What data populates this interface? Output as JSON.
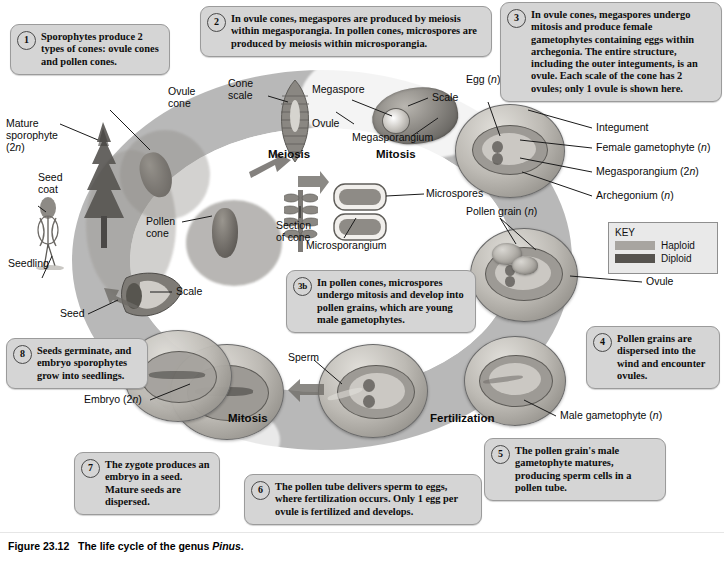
{
  "figure": {
    "number": "Figure 23.12",
    "caption": "The life cycle of the genus ",
    "caption_italic": "Pinus",
    "caption_end": "."
  },
  "key": {
    "title": "KEY",
    "items": [
      {
        "label": "Haploid",
        "color": "#a8a5a0"
      },
      {
        "label": "Diploid",
        "color": "#56534f"
      }
    ]
  },
  "callouts": [
    {
      "num": "1",
      "text": "Sporophytes produce 2 types of cones: ovule cones and pollen cones."
    },
    {
      "num": "2",
      "text": "In ovule cones, megaspores are produced by meiosis within megasporangia. In pollen cones, microspores are produced by meiosis within microsporangia."
    },
    {
      "num": "3",
      "text": "In ovule cones, megaspores undergo mitosis and produce female gametophytes containing eggs within archegonia. The entire structure, including the outer integuments, is an ovule. Each scale of the cone has 2 ovules; only 1 ovule is shown here."
    },
    {
      "num": "3b",
      "text": "In pollen cones, microspores undergo mitosis and develop into pollen grains, which are young male gametophytes."
    },
    {
      "num": "4",
      "text": "Pollen grains are dispersed into the wind and encounter ovules."
    },
    {
      "num": "5",
      "text": "The pollen grain's male gametophyte matures, producing sperm cells in a pollen tube."
    },
    {
      "num": "6",
      "text": "The pollen tube delivers sperm to eggs, where fertilization occurs. Only 1 egg per ovule is fertilized and develops."
    },
    {
      "num": "7",
      "text": "The zygote produces an embryo in a seed. Mature seeds are dispersed."
    },
    {
      "num": "8",
      "text": "Seeds germinate, and embryo sporophytes grow into seedlings."
    }
  ],
  "stages": [
    {
      "label": "Meiosis"
    },
    {
      "label": "Mitosis"
    },
    {
      "label": "Mitosis"
    },
    {
      "label": "Fertilization"
    }
  ],
  "labels": [
    {
      "name": "mature-sporophyte",
      "line1": "Mature",
      "line2": "sporophyte",
      "line3": "(2n)"
    },
    {
      "name": "seed-coat",
      "line1": "Seed",
      "line2": "coat"
    },
    {
      "name": "seedling",
      "line1": "Seedling"
    },
    {
      "name": "ovule-cone",
      "line1": "Ovule",
      "line2": "cone"
    },
    {
      "name": "cone-scale",
      "line1": "Cone",
      "line2": "scale"
    },
    {
      "name": "megaspore",
      "line1": "Megaspore"
    },
    {
      "name": "ovule-upper",
      "line1": "Ovule"
    },
    {
      "name": "scale-upper",
      "line1": "Scale"
    },
    {
      "name": "megasporangium-upper",
      "line1": "Megasporangium"
    },
    {
      "name": "egg",
      "line1": "Egg (n)"
    },
    {
      "name": "integument",
      "line1": "Integument"
    },
    {
      "name": "female-gametophyte",
      "line1": "Female gametophyte (n)"
    },
    {
      "name": "megasporangium-right",
      "line1": "Megasporangium (2n)"
    },
    {
      "name": "archegonium",
      "line1": "Archegonium (n)"
    },
    {
      "name": "pollen-cone",
      "line1": "Pollen",
      "line2": "cone"
    },
    {
      "name": "section-of-cone",
      "line1": "Section",
      "line2": "of cone"
    },
    {
      "name": "microsporangium",
      "line1": "Microsporangium"
    },
    {
      "name": "microspores",
      "line1": "Microspores"
    },
    {
      "name": "pollen-grain",
      "line1": "Pollen grain (n)"
    },
    {
      "name": "ovule-right",
      "line1": "Ovule"
    },
    {
      "name": "male-gametophyte",
      "line1": "Male gametophyte (n)"
    },
    {
      "name": "sperm",
      "line1": "Sperm"
    },
    {
      "name": "scale-left",
      "line1": "Scale"
    },
    {
      "name": "seed",
      "line1": "Seed"
    },
    {
      "name": "embryo",
      "line1": "Embryo (2n)"
    }
  ]
}
